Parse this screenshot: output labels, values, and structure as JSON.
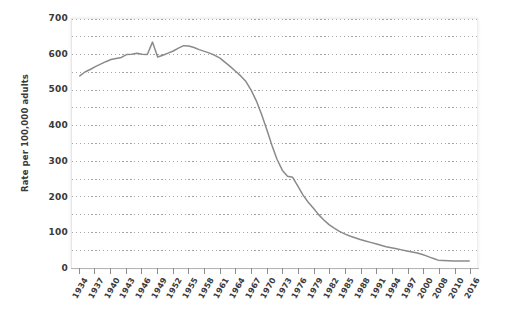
{
  "chart_data": {
    "type": "line",
    "title": "",
    "xlabel": "",
    "ylabel": "Rate per 100,000 adults",
    "ylim": [
      0,
      700
    ],
    "ytick_step": 100,
    "minor_grid_step": 50,
    "grid": true,
    "grid_style": "dotted",
    "legend": "none",
    "line_color": "#8a8a8a",
    "xtick_labels": [
      "1934",
      "1937",
      "1940",
      "1943",
      "1946",
      "1949",
      "1952",
      "1955",
      "1958",
      "1961",
      "1964",
      "1967",
      "1970",
      "1973",
      "1976",
      "1979",
      "1982",
      "1985",
      "1988",
      "1991",
      "1994",
      "1997",
      "2000",
      "2008",
      "2010",
      "2016"
    ],
    "x": [
      1934,
      1935,
      1936,
      1937,
      1938,
      1939,
      1940,
      1941,
      1942,
      1943,
      1944,
      1945,
      1946,
      1947,
      1948,
      1949,
      1950,
      1951,
      1952,
      1953,
      1954,
      1955,
      1956,
      1957,
      1958,
      1959,
      1960,
      1961,
      1962,
      1963,
      1964,
      1965,
      1966,
      1967,
      1968,
      1969,
      1970,
      1971,
      1972,
      1973,
      1974,
      1975,
      1976,
      1977,
      1978,
      1979,
      1980,
      1981,
      1982,
      1983,
      1984,
      1985,
      1986,
      1987,
      1988,
      1989,
      1990,
      1991,
      1992,
      1993,
      1994,
      1995,
      1996,
      1997,
      1998,
      1999,
      2000,
      2002,
      2004,
      2006,
      2008,
      2010,
      2012,
      2014,
      2016
    ],
    "values": [
      540,
      551,
      558,
      566,
      573,
      580,
      586,
      589,
      592,
      600,
      601,
      604,
      601,
      600,
      635,
      593,
      598,
      604,
      610,
      618,
      625,
      624,
      620,
      614,
      609,
      604,
      598,
      590,
      578,
      566,
      553,
      540,
      524,
      500,
      470,
      432,
      390,
      345,
      305,
      275,
      258,
      255,
      230,
      205,
      185,
      168,
      150,
      135,
      122,
      112,
      103,
      96,
      90,
      85,
      80,
      76,
      72,
      68,
      64,
      60,
      57,
      54,
      51,
      48,
      45,
      42,
      38,
      34,
      30,
      26,
      22,
      20,
      20,
      20,
      20
    ],
    "annotations": [
      {
        "year": 1948,
        "value": 635,
        "note": "sharp spike"
      },
      {
        "year": 1949,
        "value": 593,
        "note": "sharp drop after spike"
      },
      {
        "year": 1954,
        "value": 625,
        "note": "secondary peak"
      },
      {
        "year": 1975,
        "value": 255,
        "note": "brief plateau during steep decline"
      }
    ]
  },
  "axes": {
    "y_tick_labels": [
      "700",
      "600",
      "500",
      "400",
      "300",
      "200",
      "100",
      "0"
    ]
  }
}
